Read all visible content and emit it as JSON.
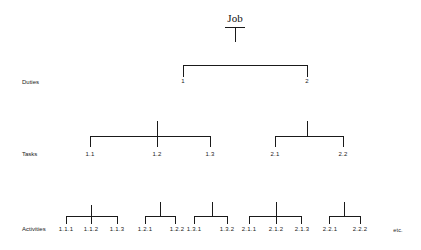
{
  "diagram": {
    "root": {
      "label": "Job"
    },
    "levels": [
      {
        "name": "Duties",
        "y": 82
      },
      {
        "name": "Tasks",
        "y": 154
      },
      {
        "name": "Activities",
        "y": 229
      }
    ],
    "duties": [
      {
        "label": "1",
        "x": 183
      },
      {
        "label": "2",
        "x": 307
      }
    ],
    "tasks": [
      {
        "label": "1.1",
        "x": 90
      },
      {
        "label": "1.2",
        "x": 157
      },
      {
        "label": "1.3",
        "x": 210
      },
      {
        "label": "2.1",
        "x": 275
      },
      {
        "label": "2.2",
        "x": 343
      }
    ],
    "activities": [
      {
        "label": "1.1.1",
        "x": 66
      },
      {
        "label": "1.1.2",
        "x": 91
      },
      {
        "label": "1.1.3",
        "x": 117
      },
      {
        "label": "1.2.1",
        "x": 145
      },
      {
        "label": "1.2.2",
        "x": 176
      },
      {
        "label": "1.3.1",
        "x": 194
      },
      {
        "label": "1.3.2",
        "x": 227
      },
      {
        "label": "2.1.1",
        "x": 249
      },
      {
        "label": "2.1.2",
        "x": 276
      },
      {
        "label": "2.1.3",
        "x": 302
      },
      {
        "label": "2.2.1",
        "x": 330
      },
      {
        "label": "2.2.2",
        "x": 360
      }
    ],
    "continuation": "etc."
  }
}
